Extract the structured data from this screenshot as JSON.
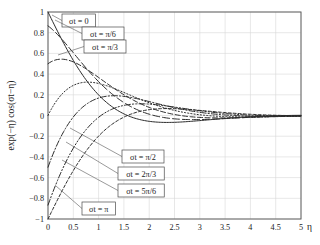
{
  "chart_data": {
    "type": "line",
    "title": "",
    "xlabel": "η",
    "ylabel": "exp(−η) cos(σt−η)",
    "xlim": [
      0,
      5
    ],
    "ylim": [
      -1,
      1
    ],
    "grid": true,
    "legend_position": "inside-annotations",
    "xticks": [
      "0",
      "0.5",
      "1",
      "1.5",
      "2",
      "2.5",
      "3",
      "3.5",
      "4",
      "4.5",
      "5"
    ],
    "xtick_values": [
      0,
      0.5,
      1,
      1.5,
      2,
      2.5,
      3,
      3.5,
      4,
      4.5,
      5
    ],
    "yticks": [
      "1",
      "0.8",
      "0.6",
      "0.4",
      "0.2",
      "0",
      "−0.2",
      "−0.4",
      "−0.6",
      "−0.8",
      "−1"
    ],
    "ytick_values": [
      1,
      0.8,
      0.6,
      0.4,
      0.2,
      0,
      -0.2,
      -0.4,
      -0.6,
      -0.8,
      -1
    ],
    "formula": "exp(-eta)*cos(sigma_t - eta)",
    "series": [
      {
        "name": "σt = 0",
        "phase_label": "0",
        "phase": 0.0,
        "dash": "solid",
        "y_at_0": 1.0,
        "values": [
          1,
          0.532,
          0.199,
          -0.016,
          -0.135,
          -0.187,
          -0.195,
          -0.178,
          -0.149,
          -0.118,
          -0.0889,
          -0.0637,
          -0.0434,
          -0.0279,
          -0.0166,
          -0.00876,
          -0.00366,
          -0.000631,
          0.000929,
          0.00156,
          0.00164
        ]
      },
      {
        "name": "σt = π/6",
        "phase_label": "π/6",
        "phase": 0.5236,
        "dash": "dash-long",
        "y_at_0": 0.866,
        "values": [
          0.866,
          0.58,
          0.334,
          0.159,
          0.0482,
          -0.0131,
          -0.0414,
          -0.0499,
          -0.0475,
          -0.04,
          -0.0311,
          -0.0227,
          -0.0157,
          -0.0103,
          -0.00624,
          -0.00341,
          -0.00157,
          -0.00046,
          0.000152,
          0.000434,
          0.000518
        ]
      },
      {
        "name": "σt = π/3",
        "phase_label": "π/3",
        "phase": 1.0472,
        "dash": "dash-med",
        "y_at_0": 0.5,
        "values": [
          0.5,
          0.52,
          0.4,
          0.27,
          0.166,
          0.0924,
          0.0446,
          0.0162,
          0.000602,
          -0.00659,
          -0.00892,
          -0.00862,
          -0.00715,
          -0.00538,
          -0.00378,
          -0.00248,
          -0.0015,
          -0.00081,
          -0.00035,
          -8e-05,
          6e-05
        ]
      },
      {
        "name": "σt = π/2",
        "phase_label": "π/2",
        "phase": 1.5708,
        "dash": "dot",
        "y_at_0": 0.0,
        "values": [
          0,
          0.291,
          0.31,
          0.262,
          0.195,
          0.133,
          0.084,
          0.0489,
          0.0256,
          0.011,
          0.00247,
          -0.00179,
          -0.00352,
          -0.00378,
          -0.00334,
          -0.00264,
          -0.00192,
          -0.00131,
          -0.00083,
          -0.00048,
          -0.00025
        ]
      },
      {
        "name": "σt = 2π/3",
        "phase_label": "2π/3",
        "phase": 2.0944,
        "dash": "dash-dot",
        "y_at_0": -0.5,
        "values": [
          -0.5,
          -0.0291,
          0.137,
          0.181,
          0.17,
          0.138,
          0.102,
          0.0709,
          0.046,
          0.0278,
          0.0152,
          0.00666,
          0.0013,
          -0.00188,
          -0.00351,
          -0.00413,
          -0.00414,
          -0.00381,
          -0.00334,
          -0.00282,
          -0.00233
        ]
      },
      {
        "name": "σt = 5π/6",
        "phase_label": "5π/6",
        "phase": 2.618,
        "dash": "dash-dotdot",
        "y_at_0": -0.866,
        "values": [
          -0.866,
          -0.336,
          -0.0624,
          0.061,
          0.0989,
          0.0993,
          0.0845,
          0.0653,
          0.047,
          0.0316,
          0.0196,
          0.0109,
          0.00472,
          0.000631,
          -0.00189,
          -0.00328,
          -0.0039,
          -0.00401,
          -0.00381,
          -0.00344,
          -0.00299
        ]
      },
      {
        "name": "σt = π",
        "phase_label": "π",
        "phase": 3.1416,
        "dash": "dash-short",
        "y_at_0": -1.0,
        "values": [
          -1,
          -0.532,
          -0.199,
          0.0161,
          0.135,
          0.187,
          0.195,
          0.178,
          0.149,
          0.118,
          0.0889,
          0.0637,
          0.0434,
          0.0279,
          0.0166,
          0.00876,
          0.00366,
          0.000631,
          -0.00093,
          -0.00156,
          -0.00164
        ]
      }
    ],
    "annotations": [
      {
        "label": "σt = 0",
        "box_x": 62,
        "box_y": 14,
        "anchor_x": 52,
        "anchor_y": 15
      },
      {
        "label": "σt = π/6",
        "box_x": 82,
        "box_y": 27,
        "anchor_x": 55,
        "anchor_y": 20
      },
      {
        "label": "σt = π/3",
        "box_x": 84,
        "box_y": 40,
        "anchor_x": 58,
        "anchor_y": 55
      },
      {
        "label": "σt = π/2",
        "box_x": 122,
        "box_y": 150,
        "anchor_x": 70,
        "anchor_y": 128
      },
      {
        "label": "σt = 2π/3",
        "box_x": 118,
        "box_y": 167,
        "anchor_x": 66,
        "anchor_y": 142
      },
      {
        "label": "σt = 5π/6",
        "box_x": 118,
        "box_y": 184,
        "anchor_x": 62,
        "anchor_y": 160
      },
      {
        "label": "σt = π",
        "box_x": 82,
        "box_y": 202,
        "anchor_x": 56,
        "anchor_y": 186
      }
    ]
  }
}
